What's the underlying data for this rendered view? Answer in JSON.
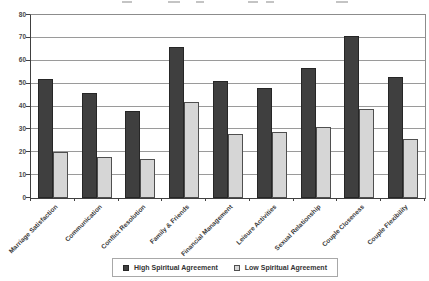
{
  "chart_data": {
    "type": "bar",
    "title": "",
    "title_note": "title cropped out of frame at top of screenshot",
    "categories": [
      "Marriage Satisfaction",
      "Communication",
      "Conflict Resolution",
      "Family & Friends",
      "Financial Management",
      "Leisure Activities",
      "Sexual Relationship",
      "Couple Closeness",
      "Couple Flexibility"
    ],
    "series": [
      {
        "name": "High Spiritual Agreement",
        "color": "#3f3f3f",
        "values": [
          52,
          46,
          38,
          66,
          51,
          48,
          57,
          71,
          53
        ]
      },
      {
        "name": "Low Spiritual Agreement",
        "color": "#d6d6d6",
        "values": [
          20,
          18,
          17,
          42,
          28,
          29,
          31,
          39,
          26
        ]
      }
    ],
    "xlabel": "",
    "ylabel": "",
    "ylim": [
      0,
      80
    ],
    "yticks": [
      0,
      10,
      20,
      30,
      40,
      50,
      60,
      70,
      80
    ],
    "grid": true,
    "legend_position": "bottom"
  },
  "colors": {
    "high_bar": "#3f3f3f",
    "low_bar": "#d6d6d6",
    "gridline": "#9a9a9a",
    "axis": "#404040",
    "text": "#3a3a3a",
    "background": "#ffffff"
  }
}
